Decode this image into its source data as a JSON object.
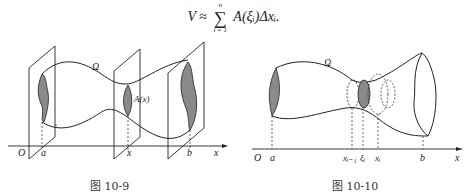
{
  "formula": {
    "lhs": "V",
    "approx": "≈",
    "sum_upper": "n",
    "sum_lower": "i = 1",
    "sum_symbol": "∑",
    "rhs": "A(ξᵢ)Δxᵢ."
  },
  "figures": [
    {
      "id": "fig-10-9",
      "caption": "图 10-9",
      "labels": {
        "solid": "Ω",
        "origin": "O",
        "a": "a",
        "x": "x",
        "b": "b",
        "axis": "x",
        "section": "A(x)"
      }
    },
    {
      "id": "fig-10-10",
      "caption": "图 10-10",
      "labels": {
        "solid": "Ω",
        "origin": "O",
        "a": "a",
        "xim1": "xᵢ₋₁",
        "xi_pt": "ξᵢ",
        "xi": "xᵢ",
        "b": "b",
        "axis": "x"
      }
    }
  ],
  "colors": {
    "line": "#222222",
    "shade": "#8a8a8a"
  }
}
